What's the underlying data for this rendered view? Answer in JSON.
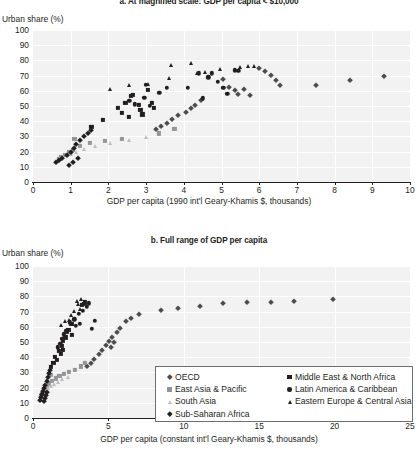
{
  "figure": {
    "ylabel": "Urban share (%)"
  },
  "chart_data": [
    {
      "id": "panel-a",
      "type": "scatter",
      "title": "a. At magnified scale: GDP per capita < $10,000",
      "xlabel": "GDP per capita (1990 int'l Geary-Khamis $, thousands)",
      "ylabel": "Urban share (%)",
      "xlim": [
        0,
        10
      ],
      "ylim": [
        0,
        100
      ],
      "xticks": [
        0,
        1,
        2,
        3,
        4,
        5,
        6,
        7,
        8,
        9,
        10
      ],
      "yticks": [
        0,
        10,
        20,
        30,
        40,
        50,
        60,
        70,
        80,
        90,
        100
      ],
      "grid": true,
      "legend_position": "none",
      "series": [
        {
          "name": "OECD",
          "marker": "diamond",
          "color": "#4d4d4f",
          "points": [
            [
              5.05,
              68.0
            ],
            [
              5.2,
              62.5
            ],
            [
              5.35,
              60.5
            ],
            [
              5.45,
              58.0
            ],
            [
              5.6,
              61.0
            ],
            [
              5.75,
              57.5
            ],
            [
              6.0,
              75.0
            ],
            [
              6.15,
              73.0
            ],
            [
              6.3,
              70.5
            ],
            [
              6.45,
              67.0
            ],
            [
              6.55,
              64.0
            ],
            [
              4.45,
              54.0
            ],
            [
              4.3,
              50.5
            ],
            [
              4.2,
              48.5
            ],
            [
              4.05,
              46.0
            ],
            [
              3.85,
              44.0
            ],
            [
              3.7,
              41.5
            ],
            [
              3.55,
              39.0
            ],
            [
              3.4,
              37.0
            ],
            [
              3.25,
              35.0
            ],
            [
              7.5,
              64.0
            ],
            [
              8.4,
              67.0
            ],
            [
              9.3,
              70.0
            ]
          ]
        },
        {
          "name": "East Asia & Pacific",
          "marker": "square",
          "color": "#939598",
          "points": [
            [
              0.7,
              15.0
            ],
            [
              0.75,
              16.5
            ],
            [
              0.85,
              18.0
            ],
            [
              0.95,
              19.5
            ],
            [
              1.05,
              21.0
            ],
            [
              1.25,
              23.5
            ],
            [
              1.5,
              25.5
            ],
            [
              1.9,
              27.0
            ],
            [
              2.35,
              28.5
            ],
            [
              3.35,
              32.0
            ],
            [
              3.75,
              35.0
            ],
            [
              1.1,
              28.5
            ]
          ]
        },
        {
          "name": "South Asia",
          "marker": "triangle",
          "color": "#bcbec0",
          "points": [
            [
              0.65,
              14.0
            ],
            [
              0.72,
              15.5
            ],
            [
              0.8,
              16.5
            ],
            [
              0.9,
              17.5
            ],
            [
              1.0,
              18.5
            ],
            [
              1.15,
              20.0
            ],
            [
              1.35,
              22.0
            ],
            [
              1.65,
              24.0
            ],
            [
              2.05,
              25.5
            ],
            [
              2.55,
              27.5
            ],
            [
              3.0,
              29.5
            ]
          ]
        },
        {
          "name": "Sub-Saharan Africa",
          "marker": "diamond",
          "color": "#231f20",
          "points": [
            [
              0.62,
              13.0
            ],
            [
              0.68,
              14.5
            ],
            [
              0.78,
              16.0
            ],
            [
              0.9,
              18.0
            ],
            [
              1.0,
              20.0
            ],
            [
              1.08,
              22.5
            ],
            [
              1.15,
              25.0
            ],
            [
              1.25,
              27.5
            ],
            [
              1.35,
              30.0
            ],
            [
              1.45,
              32.5
            ],
            [
              1.55,
              34.0
            ],
            [
              0.95,
              11.5
            ],
            [
              1.05,
              13.0
            ],
            [
              1.2,
              15.5
            ]
          ]
        },
        {
          "name": "Middle East & North Africa",
          "marker": "square",
          "color": "#231f20",
          "points": [
            [
              1.55,
              36.0
            ],
            [
              1.85,
              41.0
            ],
            [
              2.25,
              48.5
            ],
            [
              2.45,
              52.0
            ],
            [
              2.6,
              56.5
            ],
            [
              2.65,
              57.5
            ],
            [
              2.8,
              50.5
            ],
            [
              2.85,
              47.5
            ],
            [
              2.9,
              44.5
            ],
            [
              3.05,
              60.5
            ],
            [
              3.15,
              52.0
            ],
            [
              3.2,
              49.0
            ],
            [
              2.35,
              45.5
            ],
            [
              2.55,
              43.0
            ]
          ]
        },
        {
          "name": "Latin America & Caribbean",
          "marker": "circle",
          "color": "#231f20",
          "points": [
            [
              3.0,
              64.0
            ],
            [
              3.35,
              58.5
            ],
            [
              3.55,
              62.0
            ],
            [
              4.1,
              62.0
            ],
            [
              4.4,
              71.5
            ],
            [
              4.65,
              69.0
            ],
            [
              4.75,
              71.5
            ],
            [
              4.9,
              66.0
            ],
            [
              5.05,
              62.0
            ],
            [
              5.15,
              58.0
            ],
            [
              5.35,
              73.5
            ],
            [
              5.45,
              73.0
            ],
            [
              4.5,
              55.0
            ],
            [
              2.55,
              53.5
            ],
            [
              2.7,
              51.0
            ],
            [
              3.1,
              50.0
            ],
            [
              2.95,
              55.5
            ]
          ]
        },
        {
          "name": "Eastern Europe & Central Asia",
          "marker": "triangle",
          "color": "#231f20",
          "points": [
            [
              2.05,
              61.5
            ],
            [
              2.55,
              63.5
            ],
            [
              3.05,
              64.5
            ],
            [
              3.65,
              77.0
            ],
            [
              3.6,
              68.5
            ],
            [
              4.2,
              78.0
            ],
            [
              4.35,
              71.5
            ],
            [
              4.95,
              74.5
            ],
            [
              5.5,
              75.5
            ],
            [
              5.7,
              76.0
            ],
            [
              5.85,
              76.0
            ],
            [
              4.55,
              72.5
            ]
          ]
        }
      ]
    },
    {
      "id": "panel-b",
      "type": "scatter",
      "title": "b. Full range of GDP per capita",
      "xlabel": "GDP per capita (constant int'l Geary-Khamis $, thousands)",
      "ylabel": "Urban share (%)",
      "xlim": [
        0,
        25
      ],
      "ylim": [
        0,
        100
      ],
      "xticks": [
        0,
        5,
        10,
        15,
        20,
        25
      ],
      "yticks": [
        0,
        10,
        20,
        30,
        40,
        50,
        60,
        70,
        80,
        90,
        100
      ],
      "grid": true,
      "legend_position": "lower-right",
      "series": [
        {
          "name": "OECD",
          "marker": "diamond",
          "color": "#4d4d4f",
          "points": [
            [
              4.35,
              42.0
            ],
            [
              4.6,
              45.0
            ],
            [
              4.85,
              48.0
            ],
            [
              5.05,
              50.5
            ],
            [
              5.25,
              53.0
            ],
            [
              5.55,
              56.5
            ],
            [
              5.8,
              59.0
            ],
            [
              5.4,
              50.0
            ],
            [
              5.15,
              47.0
            ],
            [
              4.05,
              39.0
            ],
            [
              3.85,
              36.0
            ],
            [
              3.6,
              34.0
            ],
            [
              7.05,
              68.5
            ],
            [
              8.5,
              71.0
            ],
            [
              9.6,
              72.5
            ],
            [
              11.1,
              74.0
            ],
            [
              12.6,
              75.5
            ],
            [
              14.2,
              76.5
            ],
            [
              15.8,
              76.0
            ],
            [
              17.3,
              77.0
            ],
            [
              19.9,
              78.5
            ],
            [
              6.2,
              64.0
            ],
            [
              6.5,
              66.0
            ]
          ]
        },
        {
          "name": "East Asia & Pacific",
          "marker": "square",
          "color": "#939598",
          "points": [
            [
              0.55,
              14.5
            ],
            [
              0.62,
              16.0
            ],
            [
              0.7,
              17.5
            ],
            [
              0.8,
              19.0
            ],
            [
              0.9,
              20.5
            ],
            [
              1.05,
              22.5
            ],
            [
              1.25,
              24.5
            ],
            [
              1.5,
              26.0
            ],
            [
              1.75,
              27.5
            ],
            [
              2.05,
              29.0
            ],
            [
              2.4,
              30.5
            ],
            [
              3.15,
              34.0
            ],
            [
              3.45,
              36.0
            ],
            [
              1.15,
              28.5
            ],
            [
              2.8,
              31.5
            ]
          ]
        },
        {
          "name": "South Asia",
          "marker": "triangle",
          "color": "#bcbec0",
          "points": [
            [
              0.5,
              13.5
            ],
            [
              0.58,
              15.0
            ],
            [
              0.66,
              16.0
            ],
            [
              0.76,
              17.0
            ],
            [
              0.88,
              18.5
            ],
            [
              1.0,
              19.5
            ],
            [
              1.18,
              21.0
            ],
            [
              1.4,
              22.5
            ],
            [
              1.65,
              24.0
            ],
            [
              1.95,
              25.5
            ],
            [
              2.3,
              27.0
            ]
          ]
        },
        {
          "name": "Sub-Saharan Africa",
          "marker": "diamond",
          "color": "#231f20",
          "points": [
            [
              0.45,
              12.0
            ],
            [
              0.5,
              13.5
            ],
            [
              0.58,
              15.5
            ],
            [
              0.66,
              17.5
            ],
            [
              0.74,
              19.5
            ],
            [
              0.82,
              22.0
            ],
            [
              0.9,
              24.5
            ],
            [
              0.98,
              27.0
            ],
            [
              1.05,
              29.5
            ],
            [
              1.12,
              31.5
            ],
            [
              0.7,
              11.0
            ],
            [
              0.78,
              13.0
            ],
            [
              0.86,
              15.0
            ],
            [
              0.95,
              17.0
            ]
          ]
        },
        {
          "name": "Middle East & North Africa",
          "marker": "square",
          "color": "#231f20",
          "points": [
            [
              1.2,
              33.5
            ],
            [
              1.45,
              40.0
            ],
            [
              1.7,
              44.0
            ],
            [
              1.9,
              47.5
            ],
            [
              2.0,
              50.5
            ],
            [
              2.15,
              53.0
            ],
            [
              2.25,
              56.5
            ],
            [
              2.35,
              58.0
            ],
            [
              2.55,
              62.0
            ],
            [
              2.0,
              45.0
            ],
            [
              1.85,
              42.0
            ],
            [
              2.6,
              54.5
            ],
            [
              1.6,
              38.0
            ],
            [
              1.35,
              36.0
            ],
            [
              3.25,
              74.5
            ],
            [
              3.4,
              75.0
            ],
            [
              3.45,
              76.0
            ]
          ]
        },
        {
          "name": "Latin America & Caribbean",
          "marker": "circle",
          "color": "#231f20",
          "points": [
            [
              2.45,
              63.0
            ],
            [
              2.75,
              65.0
            ],
            [
              3.05,
              68.5
            ],
            [
              3.3,
              70.5
            ],
            [
              3.55,
              73.0
            ],
            [
              3.7,
              75.5
            ],
            [
              2.2,
              57.5
            ],
            [
              2.05,
              55.0
            ],
            [
              1.95,
              52.0
            ],
            [
              1.8,
              49.0
            ],
            [
              1.65,
              46.5
            ],
            [
              2.85,
              60.5
            ],
            [
              3.1,
              62.0
            ],
            [
              4.1,
              64.0
            ],
            [
              3.9,
              58.5
            ]
          ]
        },
        {
          "name": "Eastern Europe & Central Asia",
          "marker": "triangle",
          "color": "#231f20",
          "points": [
            [
              1.85,
              61.0
            ],
            [
              2.15,
              63.5
            ],
            [
              2.4,
              64.5
            ],
            [
              2.55,
              68.0
            ],
            [
              2.95,
              77.0
            ],
            [
              2.75,
              70.5
            ],
            [
              3.1,
              72.0
            ],
            [
              3.2,
              78.5
            ],
            [
              2.6,
              62.0
            ],
            [
              3.0,
              75.0
            ]
          ]
        }
      ]
    }
  ],
  "legend": {
    "column1": [
      {
        "label": "OECD",
        "marker": "diamond",
        "color": "#4d4d4f"
      },
      {
        "label": "East Asia & Pacific",
        "marker": "square",
        "color": "#939598"
      },
      {
        "label": "South Asia",
        "marker": "triangle",
        "color": "#bcbec0"
      },
      {
        "label": "Sub-Saharan Africa",
        "marker": "diamond",
        "color": "#231f20"
      }
    ],
    "column2": [
      {
        "label": "Middle East & North Africa",
        "marker": "square",
        "color": "#231f20"
      },
      {
        "label": "Latin America & Caribbean",
        "marker": "circle",
        "color": "#231f20"
      },
      {
        "label": "Eastern Europe & Central Asia",
        "marker": "triangle",
        "color": "#231f20"
      }
    ]
  }
}
